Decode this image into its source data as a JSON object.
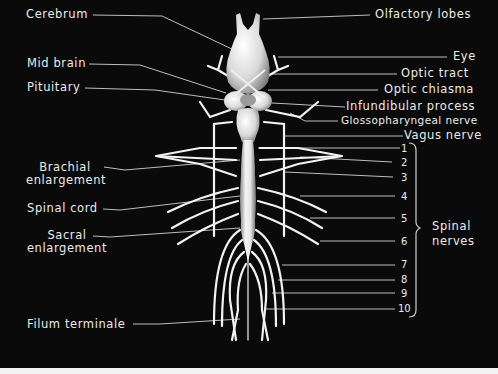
{
  "diagram": {
    "background_color": "#0a0a0a",
    "label_color": "#ecebe6",
    "left_labels": [
      {
        "id": "cerebrum",
        "text": "Cerebrum"
      },
      {
        "id": "mid-brain",
        "text": "Mid brain"
      },
      {
        "id": "pituitary",
        "text": "Pituitary"
      },
      {
        "id": "brachial-enlargement",
        "line1": "Brachial",
        "line2": "enlargement"
      },
      {
        "id": "spinal-cord",
        "text": "Spinal cord"
      },
      {
        "id": "sacral-enlargement",
        "line1": "Sacral",
        "line2": "enlargement"
      },
      {
        "id": "filum-terminale",
        "text": "Filum terminale"
      }
    ],
    "right_labels": [
      {
        "id": "olfactory-lobes",
        "text": "Olfactory lobes"
      },
      {
        "id": "eye",
        "text": "Eye"
      },
      {
        "id": "optic-tract",
        "text": "Optic tract"
      },
      {
        "id": "optic-chiasma",
        "text": "Optic chiasma"
      },
      {
        "id": "infundibular-process",
        "text": "Infundibular process"
      },
      {
        "id": "glossopharyngeal-nerve",
        "text": "Glossopharyngeal nerve"
      },
      {
        "id": "vagus-nerve",
        "text": "Vagus nerve"
      }
    ],
    "spinal_nerve_numbers": [
      "1",
      "2",
      "3",
      "4",
      "5",
      "6",
      "7",
      "8",
      "9",
      "10"
    ],
    "bracket_label": {
      "line1": "Spinal",
      "line2": "nerves"
    }
  }
}
